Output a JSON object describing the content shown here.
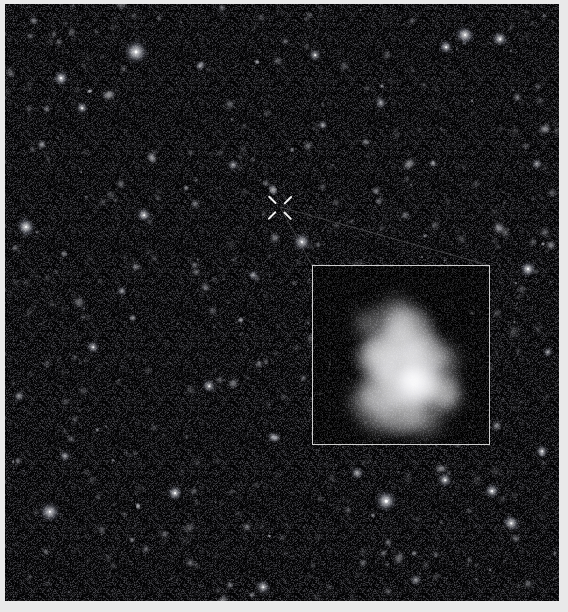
{
  "figure": {
    "kind": "astronomical-deep-field-image",
    "width": 568,
    "height": 612,
    "background_color": "#e9e9e9",
    "sky_color": "#050507"
  },
  "sky": {
    "x": 5,
    "y": 4,
    "width": 554,
    "height": 597
  },
  "marker": {
    "name": "target-x-marker",
    "x": 280,
    "y": 207,
    "color": "#f2f2f2",
    "arm_length": 11,
    "center_gap": 5.5
  },
  "inset": {
    "name": "magnified-galaxy-inset",
    "x": 312,
    "y": 265,
    "width": 176,
    "height": 178,
    "border_color": "#cfcfcf",
    "background_color": "#000000"
  },
  "connector": {
    "name": "inset-connector-lines",
    "color": "#6e6e70",
    "from_x": 280,
    "from_y": 207,
    "to_left_x": 312,
    "to_left_y": 265,
    "to_right_x": 488,
    "to_right_y": 265
  },
  "chart_data": {
    "type": "scatter",
    "title": "",
    "xlabel": "",
    "ylabel": "",
    "xlim": [
      0,
      554
    ],
    "ylim": [
      0,
      597
    ],
    "grid": false,
    "legend": "none",
    "note": "Point sources and extended sources in the deep field. b = relative brightness 0-1, r = radius in px, e = elongation, a = position angle in degrees.",
    "bright_stars": [
      {
        "x": 131,
        "y": 48,
        "r": 9.5,
        "b": 1.0,
        "e": 1.0,
        "a": 0
      },
      {
        "x": 297,
        "y": 238,
        "r": 7.0,
        "b": 0.96,
        "e": 1.0,
        "a": 0
      },
      {
        "x": 381,
        "y": 497,
        "r": 8.5,
        "b": 0.95,
        "e": 1.0,
        "a": 0
      },
      {
        "x": 45,
        "y": 508,
        "r": 7.5,
        "b": 0.9,
        "e": 1.15,
        "a": 30
      },
      {
        "x": 523,
        "y": 265,
        "r": 6.5,
        "b": 0.88,
        "e": 1.0,
        "a": 0
      },
      {
        "x": 170,
        "y": 489,
        "r": 6.0,
        "b": 0.86,
        "e": 1.1,
        "a": 0
      },
      {
        "x": 56,
        "y": 74,
        "r": 6.0,
        "b": 0.84,
        "e": 1.0,
        "a": 0
      },
      {
        "x": 460,
        "y": 31,
        "r": 6.5,
        "b": 0.86,
        "e": 1.4,
        "a": 35
      },
      {
        "x": 495,
        "y": 35,
        "r": 5.5,
        "b": 0.82,
        "e": 1.3,
        "a": 20
      },
      {
        "x": 21,
        "y": 223,
        "r": 6.5,
        "b": 0.85,
        "e": 1.4,
        "a": 60
      },
      {
        "x": 139,
        "y": 211,
        "r": 5.5,
        "b": 0.8,
        "e": 1.2,
        "a": 0
      },
      {
        "x": 487,
        "y": 487,
        "r": 6.0,
        "b": 0.84,
        "e": 1.0,
        "a": 0
      },
      {
        "x": 441,
        "y": 43,
        "r": 5.5,
        "b": 0.8,
        "e": 1.0,
        "a": 0
      },
      {
        "x": 77,
        "y": 104,
        "r": 5.0,
        "b": 0.78,
        "e": 1.0,
        "a": 0
      },
      {
        "x": 310,
        "y": 51,
        "r": 5.0,
        "b": 0.78,
        "e": 1.0,
        "a": 0
      },
      {
        "x": 376,
        "y": 99,
        "r": 4.5,
        "b": 0.74,
        "e": 1.0,
        "a": 0
      },
      {
        "x": 228,
        "y": 161,
        "r": 4.5,
        "b": 0.74,
        "e": 1.0,
        "a": 0
      },
      {
        "x": 88,
        "y": 343,
        "r": 5.0,
        "b": 0.76,
        "e": 1.0,
        "a": 0
      },
      {
        "x": 204,
        "y": 382,
        "r": 5.0,
        "b": 0.76,
        "e": 1.3,
        "a": 45
      },
      {
        "x": 268,
        "y": 433,
        "r": 4.5,
        "b": 0.72,
        "e": 1.0,
        "a": 0
      },
      {
        "x": 537,
        "y": 447,
        "r": 5.0,
        "b": 0.76,
        "e": 1.0,
        "a": 0
      },
      {
        "x": 506,
        "y": 519,
        "r": 5.5,
        "b": 0.78,
        "e": 1.5,
        "a": 25
      },
      {
        "x": 352,
        "y": 469,
        "r": 4.5,
        "b": 0.74,
        "e": 1.3,
        "a": 15
      },
      {
        "x": 440,
        "y": 476,
        "r": 5.5,
        "b": 0.78,
        "e": 1.2,
        "a": 60
      },
      {
        "x": 60,
        "y": 452,
        "r": 4.5,
        "b": 0.72,
        "e": 1.0,
        "a": 0
      },
      {
        "x": 137,
        "y": 652,
        "r": 4.0,
        "b": 0.7,
        "e": 1.0,
        "a": 0
      },
      {
        "x": 258,
        "y": 583,
        "r": 5.0,
        "b": 0.76,
        "e": 1.4,
        "a": 40
      },
      {
        "x": 411,
        "y": 576,
        "r": 4.5,
        "b": 0.72,
        "e": 1.0,
        "a": 0
      },
      {
        "x": 318,
        "y": 121,
        "r": 4.0,
        "b": 0.7,
        "e": 1.0,
        "a": 0
      },
      {
        "x": 532,
        "y": 160,
        "r": 4.5,
        "b": 0.72,
        "e": 1.0,
        "a": 0
      },
      {
        "x": 195,
        "y": 62,
        "r": 4.0,
        "b": 0.68,
        "e": 1.0,
        "a": 0
      },
      {
        "x": 248,
        "y": 271,
        "r": 4.0,
        "b": 0.68,
        "e": 1.0,
        "a": 0
      },
      {
        "x": 117,
        "y": 287,
        "r": 4.0,
        "b": 0.68,
        "e": 1.0,
        "a": 0
      },
      {
        "x": 14,
        "y": 392,
        "r": 4.5,
        "b": 0.7,
        "e": 1.0,
        "a": 0
      },
      {
        "x": 543,
        "y": 348,
        "r": 4.0,
        "b": 0.68,
        "e": 1.0,
        "a": 0
      }
    ],
    "galaxy_inset": {
      "name": "irregular-clumpy-galaxy",
      "clumps": [
        {
          "x": 56,
          "y": 58,
          "r": 13,
          "b": 0.58,
          "soft": true
        },
        {
          "x": 84,
          "y": 52,
          "r": 20,
          "b": 0.62,
          "soft": true
        },
        {
          "x": 96,
          "y": 68,
          "r": 27,
          "b": 0.7,
          "soft": false
        },
        {
          "x": 80,
          "y": 88,
          "r": 30,
          "b": 0.72,
          "soft": false
        },
        {
          "x": 64,
          "y": 92,
          "r": 22,
          "b": 0.64,
          "soft": false
        },
        {
          "x": 112,
          "y": 88,
          "r": 22,
          "b": 0.66,
          "soft": false
        },
        {
          "x": 128,
          "y": 96,
          "r": 18,
          "b": 0.58,
          "soft": true
        },
        {
          "x": 96,
          "y": 112,
          "r": 32,
          "b": 0.84,
          "soft": false
        },
        {
          "x": 104,
          "y": 118,
          "r": 22,
          "b": 0.97,
          "soft": false
        },
        {
          "x": 100,
          "y": 116,
          "r": 13,
          "b": 1.0,
          "soft": false
        },
        {
          "x": 70,
          "y": 124,
          "r": 24,
          "b": 0.66,
          "soft": false
        },
        {
          "x": 55,
          "y": 136,
          "r": 18,
          "b": 0.58,
          "soft": true
        },
        {
          "x": 128,
          "y": 124,
          "r": 20,
          "b": 0.62,
          "soft": false
        },
        {
          "x": 134,
          "y": 132,
          "r": 14,
          "b": 0.52,
          "soft": true
        },
        {
          "x": 88,
          "y": 146,
          "r": 24,
          "b": 0.62,
          "soft": false
        },
        {
          "x": 110,
          "y": 150,
          "r": 20,
          "b": 0.56,
          "soft": true
        },
        {
          "x": 66,
          "y": 152,
          "r": 16,
          "b": 0.5,
          "soft": true
        }
      ]
    }
  }
}
